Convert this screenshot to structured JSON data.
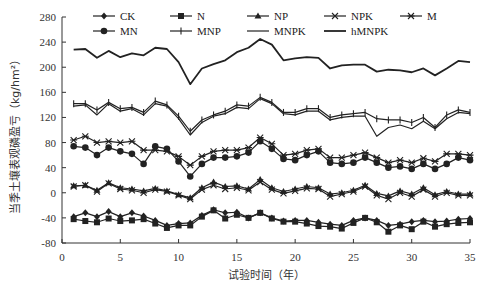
{
  "chart_data": {
    "type": "line",
    "title": "",
    "xlabel": "试验时间（年）",
    "ylabel": "当季土壤表观磷盈亏（kg/hm²）",
    "xlim": [
      0,
      35
    ],
    "ylim": [
      -80,
      280
    ],
    "xticks": [
      0,
      5,
      10,
      15,
      20,
      25,
      30,
      35
    ],
    "yticks": [
      -80,
      -40,
      0,
      40,
      80,
      120,
      160,
      200,
      240,
      280
    ],
    "grid": false,
    "legend_position": "top",
    "x": [
      1,
      2,
      3,
      4,
      5,
      6,
      7,
      8,
      9,
      10,
      11,
      12,
      13,
      14,
      15,
      16,
      17,
      18,
      19,
      20,
      21,
      22,
      23,
      24,
      25,
      26,
      27,
      28,
      29,
      30,
      31,
      32,
      33,
      34,
      35
    ],
    "series": [
      {
        "name": "CK",
        "marker": "diamond",
        "values": [
          -38,
          -32,
          -38,
          -30,
          -38,
          -32,
          -37,
          -44,
          -52,
          -49,
          -48,
          -36,
          -27,
          -32,
          -31,
          -40,
          -32,
          -40,
          -45,
          -44,
          -44,
          -47,
          -50,
          -52,
          -44,
          -40,
          -44,
          -52,
          -50,
          -46,
          -44,
          -46,
          -45,
          -42,
          -41
        ]
      },
      {
        "name": "N",
        "marker": "square",
        "values": [
          -42,
          -45,
          -47,
          -41,
          -45,
          -44,
          -42,
          -49,
          -56,
          -52,
          -52,
          -38,
          -28,
          -41,
          -35,
          -40,
          -32,
          -41,
          -46,
          -46,
          -49,
          -53,
          -54,
          -57,
          -48,
          -40,
          -47,
          -62,
          -52,
          -58,
          -46,
          -54,
          -50,
          -48,
          -47
        ]
      },
      {
        "name": "NP",
        "marker": "triangle",
        "values": [
          11,
          12,
          4,
          16,
          8,
          6,
          3,
          7,
          3,
          -3,
          -8,
          8,
          17,
          10,
          11,
          6,
          21,
          8,
          2,
          6,
          10,
          8,
          -2,
          0,
          4,
          12,
          -1,
          -5,
          3,
          -2,
          8,
          -3,
          2,
          -2,
          -2
        ]
      },
      {
        "name": "NPK",
        "marker": "x",
        "values": [
          10,
          12,
          2,
          15,
          6,
          4,
          0,
          5,
          2,
          -4,
          -10,
          5,
          12,
          6,
          8,
          4,
          17,
          5,
          -1,
          3,
          7,
          6,
          -6,
          -2,
          2,
          10,
          -4,
          -10,
          0,
          -6,
          5,
          -6,
          0,
          -4,
          -4
        ]
      },
      {
        "name": "M",
        "marker": "asterisk",
        "values": [
          84,
          90,
          80,
          82,
          80,
          82,
          68,
          68,
          66,
          58,
          44,
          58,
          66,
          68,
          68,
          72,
          88,
          78,
          60,
          62,
          68,
          70,
          56,
          56,
          60,
          64,
          56,
          48,
          52,
          48,
          55,
          50,
          62,
          62,
          60
        ]
      },
      {
        "name": "MN",
        "marker": "circle",
        "values": [
          74,
          72,
          60,
          72,
          66,
          62,
          46,
          74,
          70,
          50,
          26,
          46,
          56,
          56,
          58,
          64,
          82,
          70,
          54,
          52,
          60,
          66,
          48,
          46,
          48,
          56,
          48,
          40,
          42,
          38,
          46,
          38,
          46,
          56,
          52
        ]
      },
      {
        "name": "MNP",
        "marker": "plus",
        "values": [
          142,
          142,
          132,
          144,
          134,
          136,
          128,
          146,
          140,
          122,
          98,
          116,
          124,
          130,
          140,
          138,
          152,
          144,
          128,
          128,
          134,
          134,
          120,
          124,
          126,
          128,
          118,
          116,
          116,
          112,
          120,
          104,
          124,
          132,
          128
        ]
      },
      {
        "name": "MNPK",
        "marker": "none",
        "values": [
          138,
          140,
          124,
          142,
          130,
          134,
          124,
          142,
          138,
          118,
          92,
          112,
          122,
          126,
          136,
          134,
          150,
          142,
          126,
          124,
          130,
          130,
          116,
          120,
          122,
          122,
          90,
          104,
          108,
          102,
          114,
          102,
          118,
          128,
          126
        ]
      },
      {
        "name": "hMNPK",
        "marker": "none-bold",
        "values": [
          228,
          229,
          215,
          226,
          216,
          222,
          219,
          231,
          229,
          208,
          173,
          198,
          205,
          211,
          224,
          231,
          245,
          236,
          211,
          214,
          216,
          215,
          198,
          203,
          204,
          204,
          193,
          196,
          195,
          192,
          198,
          187,
          198,
          210,
          208
        ]
      }
    ]
  }
}
